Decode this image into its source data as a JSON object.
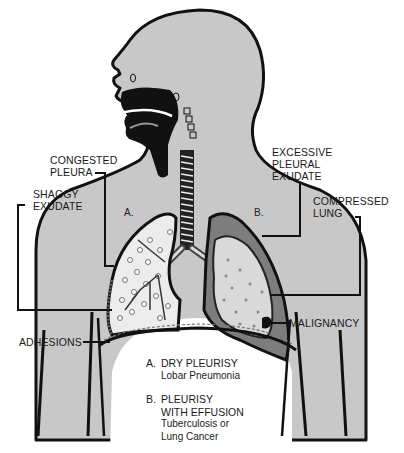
{
  "diagram": {
    "colors": {
      "skin": "#c8c8c8",
      "outline": "#111111",
      "effusion": "#7d7d7d",
      "lung_light": "#eeeeee",
      "background": "#ffffff"
    },
    "labels": {
      "congested_pleura": "CONGESTED\nPLEURA",
      "shaggy_exudate": "SHAGGY\nEXUDATE",
      "excessive_pleural_exudate": "EXCESSIVE\nPLEURAL\nEXUDATE",
      "compressed_lung": "COMPRESSED\nLUNG",
      "malignancy": "MALIGNANCY",
      "adhesions": "ADHESIONS"
    },
    "zones": {
      "a": "A.",
      "b": "B."
    },
    "legend": [
      {
        "key": "A.",
        "title": "DRY PLEURISY",
        "subtitle": "Lobar Pneumonia"
      },
      {
        "key": "B.",
        "title": "PLEURISY\nWITH EFFUSION",
        "subtitle": "Tuberculosis or\nLung Cancer"
      }
    ]
  }
}
